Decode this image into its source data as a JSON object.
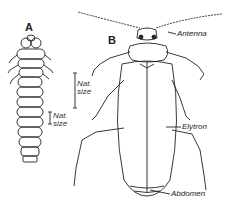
{
  "figure": {
    "panel_a": {
      "letter": "A",
      "scale_label_line1": "Nat.",
      "scale_label_line2": "size"
    },
    "panel_b": {
      "letter": "B",
      "scale_label_line1": "Nat.",
      "scale_label_line2": "size",
      "labels": {
        "antenna": "Antenna",
        "elytron": "Elytron",
        "abdomen": "Abdomen"
      }
    }
  },
  "colors": {
    "ink": "#222222",
    "background": "#ffffff"
  }
}
